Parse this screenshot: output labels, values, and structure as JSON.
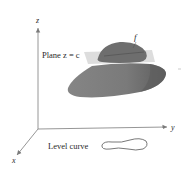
{
  "figure": {
    "axes": {
      "z_label": "z",
      "y_label": "y",
      "x_label": "x"
    },
    "plane_label": "Plane z = c",
    "surface_label": "f",
    "level_curve_label": "Level curve",
    "colors": {
      "axis": "#8a8a8a",
      "plane": "#d6d6d6",
      "surface_cap": "#6d6d6d",
      "surface_body": "#7a7a7a",
      "surface_shadow": "#5e5e5e",
      "level_curve": "#555555",
      "text": "#2a2a2a"
    }
  }
}
